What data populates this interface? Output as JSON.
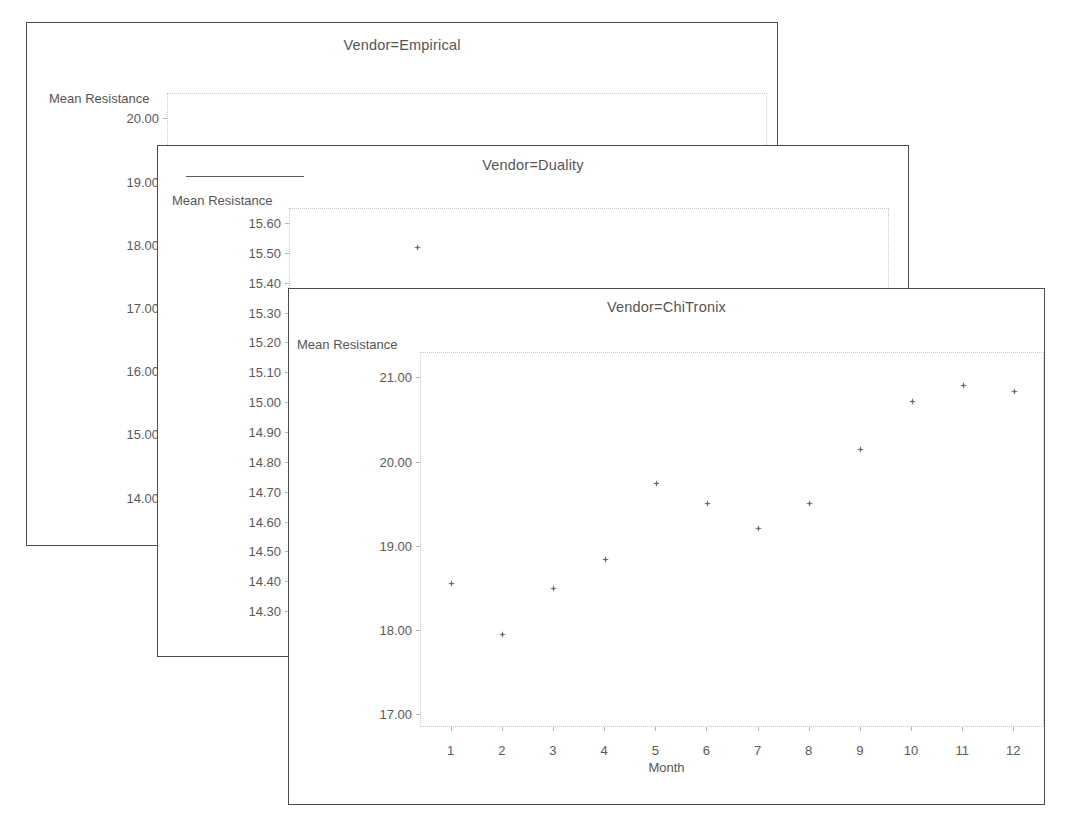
{
  "figure": {
    "kind": "trellis-scatter-panels",
    "xlabel": "Month",
    "ylabel": "Mean Resistance",
    "marker_glyph": "star-diamond-marker",
    "marker_color": "#6b6b6b",
    "frame_color": "#4c4c4c",
    "grid_color": "#c8c8c8"
  },
  "panels": [
    {
      "title": "Vendor=Empirical",
      "ylabel": "Mean Resistance",
      "yticks": [
        "20.00",
        "19.00",
        "18.00",
        "17.00",
        "16.00",
        "15.00",
        "14.00"
      ]
    },
    {
      "title": "Vendor=Duality",
      "ylabel": "Mean Resistance",
      "yticks": [
        "15.60",
        "15.50",
        "15.40",
        "15.30",
        "15.20",
        "15.10",
        "15.00",
        "14.90",
        "14.80",
        "14.70",
        "14.60",
        "14.50",
        "14.40",
        "14.30"
      ]
    },
    {
      "title": "Vendor=ChiTronix",
      "ylabel": "Mean Resistance",
      "yticks": [
        "21.00",
        "20.00",
        "19.00",
        "18.00",
        "17.00"
      ],
      "xticks": [
        "1",
        "2",
        "3",
        "4",
        "5",
        "6",
        "7",
        "8",
        "9",
        "10",
        "11",
        "12"
      ],
      "xlabel": "Month"
    }
  ],
  "chart_data": [
    {
      "type": "scatter",
      "title": "Vendor=Empirical",
      "xlabel": "Month",
      "ylabel": "Mean Resistance",
      "x": [
        2
      ],
      "y": [
        18.95
      ],
      "ylim": [
        13.6,
        20.4
      ],
      "xlim": [
        0.4,
        12.6
      ],
      "yticks": [
        20.0,
        19.0,
        18.0,
        17.0,
        16.0,
        15.0,
        14.0
      ],
      "grid": false,
      "legend": "none",
      "note": "Only the month-2 marker is visible; remaining points are hidden behind the overlapping panels."
    },
    {
      "type": "scatter",
      "title": "Vendor=Duality",
      "xlabel": "Month",
      "ylabel": "Mean Resistance",
      "x": [
        3,
        7
      ],
      "y": [
        15.52,
        15.25
      ],
      "ylim": [
        14.25,
        15.65
      ],
      "xlim": [
        0.4,
        12.6
      ],
      "yticks": [
        15.6,
        15.5,
        15.4,
        15.3,
        15.2,
        15.1,
        15.0,
        14.9,
        14.8,
        14.7,
        14.6,
        14.5,
        14.4,
        14.3
      ],
      "grid": false,
      "legend": "none",
      "note": "Only the month-3 and month-7 markers are visible; remaining points are occluded by the front panel."
    },
    {
      "type": "scatter",
      "title": "Vendor=ChiTronix",
      "xlabel": "Month",
      "ylabel": "Mean Resistance",
      "categories": [
        1,
        2,
        3,
        4,
        5,
        6,
        7,
        8,
        9,
        10,
        11,
        12
      ],
      "x": [
        1,
        2,
        3,
        4,
        5,
        6,
        7,
        8,
        9,
        10,
        11,
        12
      ],
      "y": [
        18.56,
        17.96,
        18.51,
        18.85,
        19.75,
        19.52,
        19.22,
        19.52,
        20.16,
        20.72,
        20.92,
        20.84
      ],
      "ylim": [
        16.85,
        21.3
      ],
      "xlim": [
        0.4,
        12.6
      ],
      "yticks": [
        21.0,
        20.0,
        19.0,
        18.0,
        17.0
      ],
      "xticks": [
        1,
        2,
        3,
        4,
        5,
        6,
        7,
        8,
        9,
        10,
        11,
        12
      ],
      "grid": false,
      "legend": "none"
    }
  ]
}
